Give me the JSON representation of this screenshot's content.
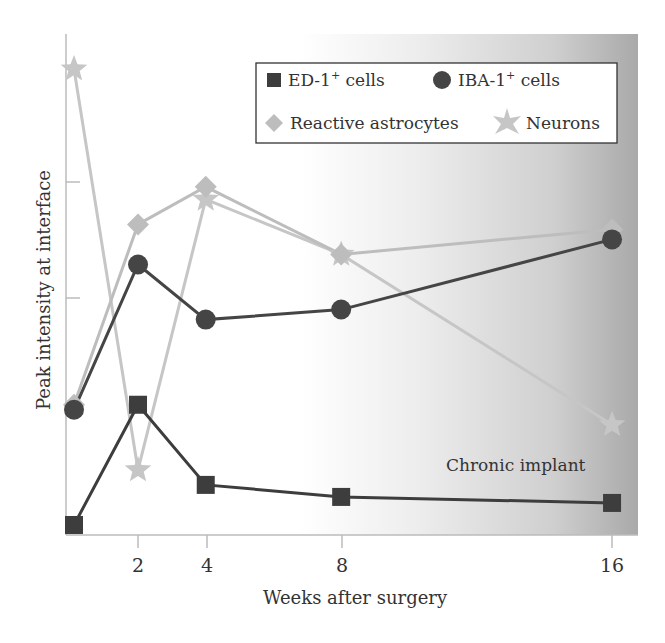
{
  "chart_data": {
    "type": "line",
    "title": "",
    "xlabel": "Weeks after surgery",
    "ylabel": "Peak intensity at interface",
    "x": [
      0.1,
      2,
      4,
      8,
      16
    ],
    "x_ticks": [
      2,
      4,
      8,
      16
    ],
    "x_tick_labels": [
      "2",
      "4",
      "8",
      "16"
    ],
    "y_ticks_unlabeled": [
      50,
      70
    ],
    "xlim": [
      0,
      17
    ],
    "ylim": [
      0,
      100
    ],
    "grid": false,
    "legend_position": "upper right",
    "series": [
      {
        "name": "ED-1⁺ cells",
        "marker": "square",
        "color": "#3d3d3d",
        "values": [
          2,
          26,
          10,
          7.6,
          6.4
        ]
      },
      {
        "name": "IBA-1⁺ cells",
        "marker": "circle",
        "color": "#454545",
        "values": [
          25,
          54,
          43,
          45,
          59
        ]
      },
      {
        "name": "Reactive astrocytes",
        "marker": "diamond",
        "color": "#bdbdbd",
        "values": [
          26,
          62,
          69.5,
          56,
          61
        ]
      },
      {
        "name": "Neurons",
        "marker": "star",
        "color": "#c6c6c6",
        "values": [
          93,
          13,
          67,
          56,
          22
        ]
      }
    ],
    "annotations": [
      {
        "text": "Chronic implant",
        "region": "shaded gradient from ~week 7 to 17"
      }
    ]
  },
  "labels": {
    "xlabel": "Weeks after surgery",
    "ylabel": "Peak intensity at interface",
    "annotation": "Chronic implant",
    "ticks": [
      "2",
      "4",
      "8",
      "16"
    ],
    "legend": {
      "ed1_prefix": "ED-1",
      "ed1_sup": "+",
      "ed1_suffix": " cells",
      "iba1_prefix": "IBA-1",
      "iba1_sup": "+",
      "iba1_suffix": " cells",
      "astro": "Reactive astrocytes",
      "neurons": "Neurons"
    }
  }
}
